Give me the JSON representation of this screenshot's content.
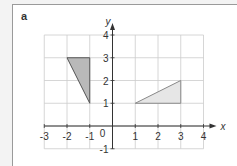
{
  "panel_label": "a",
  "axes": {
    "x_label": "x",
    "y_label": "y",
    "x_ticks": [
      "-3",
      "-2",
      "-1",
      "1",
      "2",
      "3",
      "4"
    ],
    "y_ticks": [
      "4",
      "3",
      "2",
      "1",
      "-1"
    ],
    "origin_label": "0",
    "xlim": [
      -3,
      4
    ],
    "ylim": [
      -1,
      4
    ]
  },
  "shapes": [
    {
      "name": "triangle-dark",
      "vertices": [
        [
          -2,
          3
        ],
        [
          -1,
          3
        ],
        [
          -1,
          1
        ]
      ],
      "fill": "#b9b9b9",
      "stroke": "#555555"
    },
    {
      "name": "triangle-light",
      "vertices": [
        [
          1,
          1
        ],
        [
          3,
          1
        ],
        [
          3,
          2
        ]
      ],
      "fill": "#e6e6e6",
      "stroke": "#888888"
    }
  ],
  "colors": {
    "grid": "#cccccc",
    "axis": "#333333"
  }
}
